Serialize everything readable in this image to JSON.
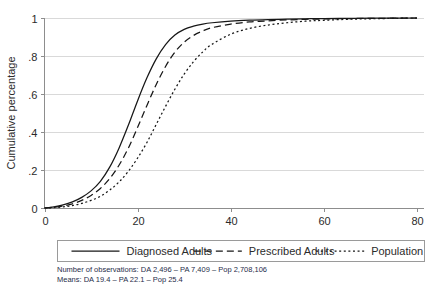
{
  "chart_data": {
    "type": "line",
    "title": "",
    "xlabel": "",
    "ylabel": "Cumulative percentage",
    "xlim": [
      0,
      80
    ],
    "ylim": [
      0,
      1
    ],
    "xticks": [
      0,
      20,
      40,
      60,
      80
    ],
    "xtick_labels": [
      "0",
      "20",
      "40",
      "60",
      "80"
    ],
    "yticks": [
      0,
      0.2,
      0.4,
      0.6,
      0.8,
      1
    ],
    "ytick_labels": [
      "0",
      ".2",
      ".4",
      ".6",
      ".8",
      "1"
    ],
    "grid": "horizontal",
    "legend_position": "below-axes",
    "series": [
      {
        "name": "Diagnosed Adults",
        "style": "solid",
        "mean": 19.4,
        "n_observations": 2496,
        "x": [
          0,
          2,
          4,
          6,
          8,
          10,
          12,
          14,
          16,
          18,
          20,
          22,
          24,
          26,
          28,
          30,
          32,
          34,
          36,
          40,
          44,
          48,
          52,
          56,
          60,
          65,
          70,
          75,
          80
        ],
        "values": [
          0.0,
          0.006,
          0.016,
          0.032,
          0.056,
          0.09,
          0.14,
          0.215,
          0.315,
          0.435,
          0.565,
          0.685,
          0.785,
          0.86,
          0.91,
          0.94,
          0.957,
          0.968,
          0.975,
          0.984,
          0.989,
          0.992,
          0.994,
          0.996,
          0.997,
          0.998,
          0.999,
          0.9995,
          1.0
        ]
      },
      {
        "name": "Prescribed Adults",
        "style": "dashed",
        "mean": 22.1,
        "n_observations": 7409,
        "x": [
          0,
          2,
          4,
          6,
          8,
          10,
          12,
          14,
          16,
          18,
          20,
          22,
          24,
          26,
          28,
          30,
          32,
          34,
          36,
          40,
          44,
          48,
          52,
          56,
          60,
          65,
          70,
          75,
          80
        ],
        "values": [
          0.0,
          0.004,
          0.011,
          0.022,
          0.04,
          0.066,
          0.103,
          0.155,
          0.225,
          0.315,
          0.425,
          0.54,
          0.65,
          0.745,
          0.82,
          0.873,
          0.908,
          0.932,
          0.949,
          0.968,
          0.979,
          0.985,
          0.99,
          0.993,
          0.995,
          0.997,
          0.998,
          0.999,
          1.0
        ]
      },
      {
        "name": "Population",
        "style": "dotted",
        "mean": 25.4,
        "n_observations": 2708106,
        "x": [
          0,
          2,
          4,
          6,
          8,
          10,
          12,
          14,
          16,
          18,
          20,
          22,
          24,
          26,
          28,
          30,
          32,
          34,
          36,
          40,
          44,
          48,
          52,
          56,
          60,
          65,
          70,
          75,
          80
        ],
        "values": [
          0.0,
          0.002,
          0.006,
          0.013,
          0.024,
          0.04,
          0.062,
          0.094,
          0.137,
          0.193,
          0.263,
          0.345,
          0.44,
          0.535,
          0.625,
          0.705,
          0.77,
          0.822,
          0.862,
          0.915,
          0.945,
          0.963,
          0.975,
          0.983,
          0.988,
          0.993,
          0.996,
          0.998,
          1.0
        ]
      }
    ],
    "annotations": [
      "Number of observations: DA 2,496 – PA 7,409 – Pop 2,708,106",
      "Means: DA 19.4 – PA 22.1 – Pop 25.4"
    ]
  },
  "legend": {
    "entries": [
      {
        "label": "Diagnosed Adults",
        "style": "solid"
      },
      {
        "label": "Prescribed Adults",
        "style": "dashed"
      },
      {
        "label": "Population",
        "style": "dotted"
      }
    ]
  },
  "notes": {
    "line1": "Number of observations: DA 2,496 – PA 7,409 – Pop 2,708,106",
    "line2": "Means: DA 19.4 – PA 22.1 – Pop 25.4"
  },
  "colors": {
    "series": "#171717",
    "grid": "#d9d9d9",
    "axis": "#8d8d8d",
    "text": "#2b2b2b",
    "note": "#1f2d4a",
    "background": "#ffffff"
  }
}
